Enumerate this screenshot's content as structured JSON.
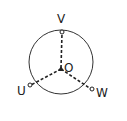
{
  "diagram": {
    "type": "three-phase star (Y) connection",
    "nodes": [
      {
        "id": "V",
        "label": "V"
      },
      {
        "id": "U",
        "label": "U"
      },
      {
        "id": "W",
        "label": "W"
      },
      {
        "id": "O",
        "label": "O",
        "role": "neutral"
      }
    ],
    "edges": [
      {
        "from": "O",
        "to": "V",
        "style": "dashed"
      },
      {
        "from": "O",
        "to": "U",
        "style": "dashed"
      },
      {
        "from": "O",
        "to": "W",
        "style": "dashed"
      }
    ],
    "outline": "circle",
    "colors": {
      "stroke": "#222222",
      "background": "#ffffff"
    }
  }
}
